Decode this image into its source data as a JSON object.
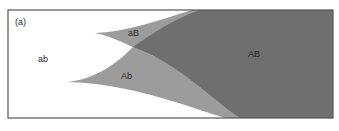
{
  "panel_label": "(a)",
  "regions": [
    {
      "label": "ab",
      "color": "#ffffff"
    },
    {
      "label": "aB",
      "color": "#9c9c9c"
    },
    {
      "label": "Ab",
      "color": "#9c9c9c"
    },
    {
      "label": "AB",
      "color": "#6f6f6f"
    }
  ],
  "frame_color": "#555555"
}
